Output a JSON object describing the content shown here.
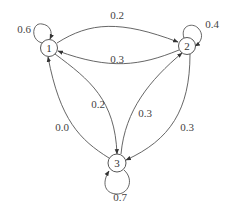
{
  "diagram": {
    "type": "markov-chain-state-transition",
    "nodes": [
      {
        "id": "1",
        "label": "1"
      },
      {
        "id": "2",
        "label": "2"
      },
      {
        "id": "3",
        "label": "3"
      }
    ],
    "edges": [
      {
        "from": "1",
        "to": "1",
        "label": "0.6"
      },
      {
        "from": "1",
        "to": "2",
        "label": "0.2"
      },
      {
        "from": "2",
        "to": "1",
        "label": "0.3"
      },
      {
        "from": "2",
        "to": "2",
        "label": "0.4"
      },
      {
        "from": "1",
        "to": "3",
        "label": "0.2"
      },
      {
        "from": "3",
        "to": "2",
        "label": "0.3"
      },
      {
        "from": "2",
        "to": "3",
        "label": "0.3"
      },
      {
        "from": "3",
        "to": "1",
        "label": "0.0"
      },
      {
        "from": "3",
        "to": "3",
        "label": "0.7"
      }
    ]
  }
}
